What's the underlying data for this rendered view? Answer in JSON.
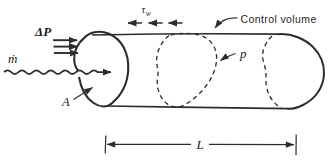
{
  "figure": {
    "background": "#ffffff",
    "ink_color": "#2c2c2c",
    "labels": {
      "pressure_drop": "ΔP",
      "wall_shear": "τ",
      "wall_shear_subscript": "w",
      "control_volume": "Control volume",
      "mass_flow": "ṁ",
      "pressure": "p",
      "area": "A",
      "length": "L"
    }
  }
}
